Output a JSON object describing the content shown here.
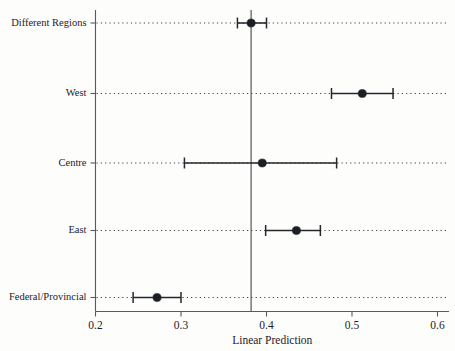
{
  "chart_data": {
    "type": "scatter",
    "subtype": "forest-plot",
    "title": "",
    "xlabel": "Linear Prediction",
    "ylabel": "",
    "xlim": [
      0.2,
      0.6
    ],
    "xticks": [
      0.2,
      0.3,
      0.4,
      0.5,
      0.6
    ],
    "xtick_labels": [
      "0.2",
      "0.3",
      "0.4",
      "0.5",
      "0.6"
    ],
    "grid": "horizontal-dotted",
    "legend": "none",
    "reference_line": {
      "orientation": "vertical",
      "value": 0.382
    },
    "categories": [
      "Different Regions",
      "West",
      "Centre",
      "East",
      "Federal/Provincial"
    ],
    "values": [
      0.382,
      0.512,
      0.395,
      0.435,
      0.272
    ],
    "ci_low": [
      0.366,
      0.476,
      0.304,
      0.399,
      0.244
    ],
    "ci_high": [
      0.4,
      0.548,
      0.482,
      0.463,
      0.3
    ],
    "points": [
      {
        "category": "Different Regions",
        "estimate": 0.382,
        "ci_low": 0.366,
        "ci_high": 0.4
      },
      {
        "category": "West",
        "estimate": 0.512,
        "ci_low": 0.476,
        "ci_high": 0.548
      },
      {
        "category": "Centre",
        "estimate": 0.395,
        "ci_low": 0.304,
        "ci_high": 0.482
      },
      {
        "category": "East",
        "estimate": 0.435,
        "ci_low": 0.399,
        "ci_high": 0.463
      },
      {
        "category": "Federal/Provincial",
        "estimate": 0.272,
        "ci_low": 0.244,
        "ci_high": 0.3
      }
    ],
    "colors": {
      "marker": "#1b1f23",
      "interval": "#24282c",
      "axis": "#555b63",
      "grid": "#3a3f45",
      "reference": "#4b5159",
      "background": "#fdfdfc"
    }
  }
}
